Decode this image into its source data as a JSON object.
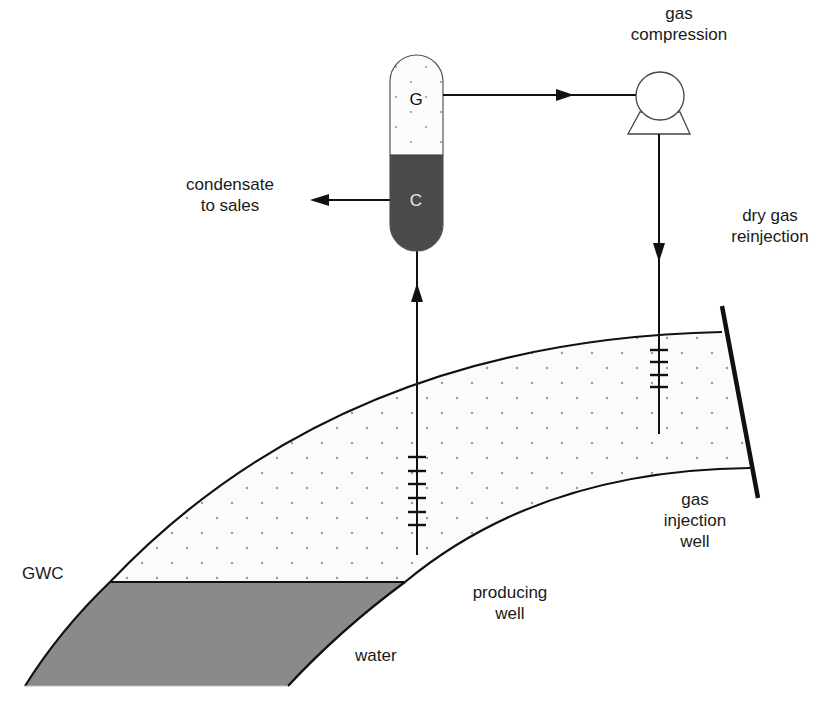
{
  "diagram": {
    "colors": {
      "line": "#111111",
      "water": "#8a8a8a",
      "condensate": "#4a4a4a",
      "gas_fill": "#fbfbfb",
      "dot": "#9a9a9a",
      "vessel_gas_text": "#111111",
      "vessel_condensate_text": "#e8e8e8"
    },
    "separator": {
      "gas_label": "G",
      "condensate_label": "C"
    },
    "labels": {
      "gas_compression": [
        "gas",
        "compression"
      ],
      "condensate_to_sales": [
        "condensate",
        "to sales"
      ],
      "dry_gas_reinjection": [
        "dry gas",
        "reinjection"
      ],
      "gas_injection_well": [
        "gas",
        "injection",
        "well"
      ],
      "producing_well": [
        "producing",
        "well"
      ],
      "gwc": "GWC",
      "water": "water"
    },
    "flows": [
      {
        "from": "producing well",
        "to": "separator",
        "direction": "up"
      },
      {
        "from": "separator (G)",
        "to": "gas compression",
        "direction": "right"
      },
      {
        "from": "separator (C)",
        "to": "condensate to sales",
        "direction": "left"
      },
      {
        "from": "gas compression",
        "to": "gas injection well",
        "direction": "down"
      }
    ],
    "producing_well_perforations": 6,
    "injection_well_perforations": 4
  }
}
